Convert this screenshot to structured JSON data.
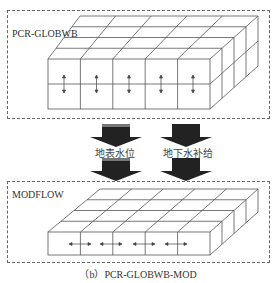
{
  "top_panel": {
    "label": "PCR-GLOBWB",
    "layers": 2,
    "columns": 5,
    "arrow_direction": "vertical"
  },
  "flows": [
    {
      "label": "地表水位",
      "icon": "down-arrow-icon"
    },
    {
      "label": "地下水补给",
      "icon": "down-arrow-icon"
    }
  ],
  "bottom_panel": {
    "label": "MODFLOW",
    "layers": 1,
    "columns": 5,
    "arrow_direction": "horizontal"
  },
  "caption": "（b）PCR-GLOBWB-MOD",
  "colors": {
    "line": "#555555",
    "arrow_fill": "#222222",
    "dash": "#666666"
  }
}
